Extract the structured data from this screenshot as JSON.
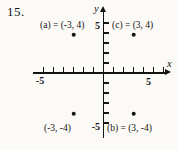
{
  "problem_number": "15.",
  "chart_data": {
    "type": "scatter",
    "title": "",
    "xlabel": "x",
    "ylabel": "y",
    "xlim": [
      -7,
      7
    ],
    "ylim": [
      -6.5,
      6.5
    ],
    "grid": false,
    "x_ticks": [
      -6,
      -5,
      -4,
      -3,
      -2,
      -1,
      1,
      2,
      3,
      4,
      5,
      6
    ],
    "y_ticks": [
      -5,
      -4,
      -3,
      -2,
      -1,
      1,
      2,
      3,
      4,
      5
    ],
    "axis_tick_labels": {
      "x_neg": "-5",
      "x_pos": "5",
      "y_pos": "5",
      "y_neg": "-5"
    },
    "point_color": "#141414",
    "points": [
      {
        "name": "a",
        "label": "(a) = (-3, 4)",
        "x": -3,
        "y": 4
      },
      {
        "name": "c",
        "label": "(c) = (3, 4)",
        "x": 3,
        "y": 4
      },
      {
        "name": "",
        "label": "(-3, -4)",
        "x": -3,
        "y": -4
      },
      {
        "name": "b",
        "label": "(b) = (3, -4)",
        "x": 3,
        "y": -4
      }
    ]
  }
}
